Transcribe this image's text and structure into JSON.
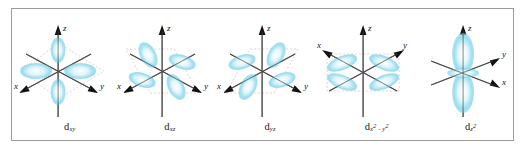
{
  "figure": {
    "background_color": "#ffffff",
    "frame_color": "#9b9b9b",
    "lobe_color": "#8fdcef",
    "lobe_color_light": "#d9f2fa",
    "lobe_color_core": "#ffffff",
    "axis_color": "#3a3a3a",
    "plane_color": "#d9bfc4"
  },
  "axes": {
    "z_label": "z",
    "x_label": "x",
    "y_label": "y"
  },
  "orbitals": [
    {
      "id": "dxy",
      "name": "d-xy-orbital",
      "base": "d",
      "sub": "xy",
      "sup": "",
      "plane": "xy",
      "lobe_count": 4,
      "description": "four lobes in the horizontal xy plane, between the x and y axes"
    },
    {
      "id": "dxz",
      "name": "d-xz-orbital",
      "base": "d",
      "sub": "xz",
      "sup": "",
      "plane": "xz",
      "lobe_count": 4,
      "description": "four lobes in the vertical xz plane, between the x and z axes"
    },
    {
      "id": "dyz",
      "name": "d-yz-orbital",
      "base": "d",
      "sub": "yz",
      "sup": "",
      "plane": "yz",
      "lobe_count": 4,
      "description": "four lobes in the vertical yz plane, between the y and z axes"
    },
    {
      "id": "dx2y2",
      "name": "d-x2-y2-orbital",
      "base": "d",
      "sub": "x",
      "sup": "2",
      "sub2": " - y",
      "sup2": "2",
      "plane": "xy",
      "lobe_count": 4,
      "description": "four lobes along the x and y axes"
    },
    {
      "id": "dz2",
      "name": "d-z2-orbital",
      "base": "d",
      "sub": "z",
      "sup": "2",
      "plane": "z",
      "lobe_count": 2,
      "description": "two lobes along the z axis with a toroidal ring in the xy plane"
    }
  ]
}
